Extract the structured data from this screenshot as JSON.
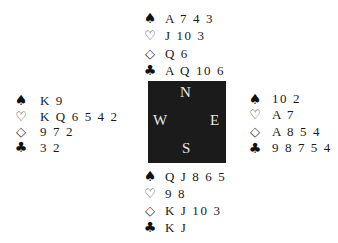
{
  "diagram": {
    "type": "bridge-deal",
    "suit_symbols": {
      "spades": "♠",
      "hearts": "♡",
      "diamonds": "◇",
      "clubs": "♣"
    },
    "compass": {
      "north": "N",
      "south": "S",
      "east": "E",
      "west": "W",
      "background_color": "#1b1b1b",
      "text_color": "#e8e8e8"
    },
    "hands": {
      "north": {
        "spades": "A 7 4 3",
        "hearts": "J 10 3",
        "diamonds": "Q 6",
        "clubs": "A Q 10 6"
      },
      "west": {
        "spades": "K 9",
        "hearts": "K Q 6 5 4 2",
        "diamonds": "9 7 2",
        "clubs": "3 2"
      },
      "east": {
        "spades": "10 2",
        "hearts": "A 7",
        "diamonds": "A 8 5 4",
        "clubs": "9 8 7 5 4"
      },
      "south": {
        "spades": "Q J 8 6 5",
        "hearts": "9 8",
        "diamonds": "K J 10 3",
        "clubs": "K J"
      }
    }
  }
}
